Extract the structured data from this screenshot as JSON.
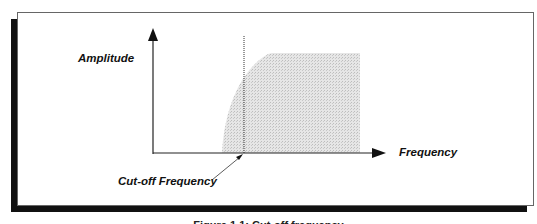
{
  "diagram": {
    "type": "high-pass filter frequency response sketch",
    "y_axis_label": "Amplitude",
    "x_axis_label": "Frequency",
    "annotation_label": "Cut-off Frequency",
    "caption": "Figure 1.1: Cut-off frequency",
    "colors": {
      "frame_border": "#666666",
      "shadow": "#111111",
      "axis": "#222222",
      "shaded_passband": "#d9d9d9",
      "text": "#111111"
    }
  }
}
